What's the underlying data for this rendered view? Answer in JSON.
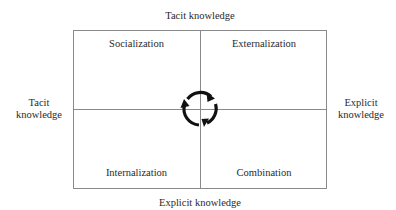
{
  "diagram": {
    "axes": {
      "top": "Tacit knowledge",
      "bottom": "Explicit knowledge",
      "left": [
        "Tacit",
        "knowledge"
      ],
      "right": [
        "Explicit",
        "knowledge"
      ]
    },
    "quadrants": {
      "top_left": "Socialization",
      "top_right": "Externalization",
      "bottom_left": "Internalization",
      "bottom_right": "Combination"
    },
    "center_icon": "cycle-arrows-icon",
    "line_color": "#8a8a8a",
    "text_color": "#2a2a2a"
  }
}
